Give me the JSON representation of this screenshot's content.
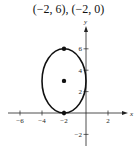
{
  "title": "(−2, 6), (−2, 0)",
  "chart_data": {
    "type": "scatter",
    "title": "(−2, 6), (−2, 0)",
    "xlabel": "x",
    "ylabel": "y",
    "xlim": [
      -7,
      3
    ],
    "ylim": [
      -3,
      7
    ],
    "grid": false,
    "x_ticks": [
      -6,
      -4,
      -2,
      2
    ],
    "x_tick_labels": [
      "−6",
      "−4",
      "−2",
      "2"
    ],
    "y_ticks": [
      -2,
      2,
      4,
      6
    ],
    "y_tick_labels": [
      "−2",
      "2",
      "4",
      "6"
    ],
    "shapes": [
      {
        "type": "ellipse",
        "center": [
          -2,
          3
        ],
        "semi_axis_x": 2,
        "semi_axis_y": 3
      }
    ],
    "points": [
      {
        "label": "vertex",
        "x": -2,
        "y": 6
      },
      {
        "label": "center",
        "x": -2,
        "y": 3
      },
      {
        "label": "vertex",
        "x": -2,
        "y": 0
      }
    ]
  }
}
